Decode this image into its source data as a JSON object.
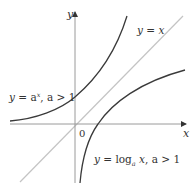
{
  "figure": {
    "axes": {
      "x_label": "x",
      "y_label": "y",
      "origin_label": "0"
    },
    "curves": [
      {
        "id": "exponential",
        "label_y": "y",
        "label_eq": " = a",
        "label_sup": "x",
        "label_cond": ", a > 1",
        "color": "#3a3a3a"
      },
      {
        "id": "identity",
        "label": "y = x",
        "color": "#bbbbbb"
      },
      {
        "id": "logarithm",
        "label_y": "y",
        "label_eq": " = log",
        "label_sub": "a",
        "label_x": " x",
        "label_cond": ",  a > 1",
        "color": "#3a3a3a"
      }
    ],
    "colors": {
      "axis": "#9a9a9a",
      "curve": "#3a3a3a",
      "identity_line": "#c4c4c4",
      "text": "#333333"
    }
  }
}
